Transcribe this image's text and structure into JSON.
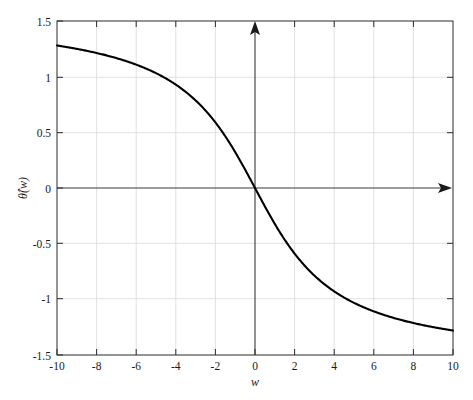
{
  "figure": {
    "background_color": "#ffffff",
    "curve_color": "#000000",
    "axis_color": "#3a3a3a",
    "frame_color": "#2b2b2b",
    "grid_color": "#d9d9d9"
  },
  "axis_titles": {
    "x": "w",
    "y": "θ̂(w)"
  },
  "x_tick_labels": [
    "-10",
    "-8",
    "-6",
    "-4",
    "-2",
    "0",
    "2",
    "4",
    "6",
    "8",
    "10"
  ],
  "y_tick_labels": [
    "1.5",
    "1",
    "0.5",
    "0",
    "-0.5",
    "-1",
    "-1.5"
  ],
  "chart_data": {
    "type": "line",
    "title": "",
    "subtitle": "",
    "xlabel": "w",
    "ylabel": "θ̂(w)",
    "xlim": [
      -10,
      10
    ],
    "ylim": [
      -1.5,
      1.5
    ],
    "xticks": [
      -10,
      -8,
      -6,
      -4,
      -2,
      0,
      2,
      4,
      6,
      8,
      10
    ],
    "yticks": [
      1.5,
      1,
      0.5,
      0,
      -0.5,
      -1,
      -1.5
    ],
    "grid": true,
    "legend": "none",
    "annotations": [
      "vertical axis arrow at w = 0 pointing up",
      "horizontal axis arrow at theta-hat = 0 pointing right"
    ],
    "series": [
      {
        "name": "theta-hat(w)",
        "color": "#000000",
        "x": [
          -10,
          -9.5,
          -9,
          -8.5,
          -8,
          -7.5,
          -7,
          -6.5,
          -6,
          -5.5,
          -5,
          -4.5,
          -4,
          -3.5,
          -3,
          -2.5,
          -2,
          -1.5,
          -1,
          -0.5,
          0,
          0.5,
          1,
          1.5,
          2,
          2.5,
          3,
          3.5,
          4,
          4.5,
          5,
          5.5,
          6,
          6.5,
          7,
          7.5,
          8,
          8.5,
          9,
          9.5,
          10
        ],
        "y": [
          1.28,
          1.265,
          1.249,
          1.232,
          1.213,
          1.192,
          1.17,
          1.145,
          1.119,
          1.089,
          1.057,
          1.021,
          0.983,
          0.94,
          0.893,
          0.843,
          0.788,
          0.729,
          0.665,
          0.598,
          0,
          -0.598,
          -0.665,
          -0.729,
          -0.788,
          -0.843,
          -0.893,
          -0.94,
          -0.983,
          -1.021,
          -1.057,
          -1.089,
          -1.119,
          -1.145,
          -1.17,
          -1.192,
          -1.213,
          -1.232,
          -1.249,
          -1.265,
          -1.28
        ]
      }
    ],
    "note": "Odd, monotonically decreasing sigmoid passing through the origin; equals approximately -arctan(w/3), saturating near +/-1.28 at the plot edges."
  }
}
